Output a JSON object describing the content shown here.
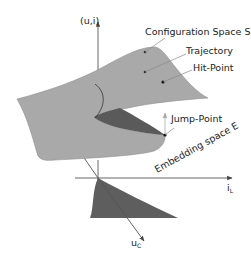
{
  "diagram": {
    "labels": {
      "vertical_axis": "(u,i)",
      "horizontal_axis": "i",
      "horizontal_axis_sub": "L",
      "depth_axis": "u",
      "depth_axis_sub": "C",
      "configuration_space": "Configuration Space S",
      "trajectory": "Trajectory",
      "hit_point": "Hit-Point",
      "jump_point": "Jump-Point",
      "embedding_space": "Embedding space E"
    },
    "colors": {
      "surface_light": "#a9a9a9",
      "surface_dark": "#5a5a5a",
      "projection": "#5e5e5e",
      "axis": "#555555",
      "text": "#222222"
    }
  }
}
